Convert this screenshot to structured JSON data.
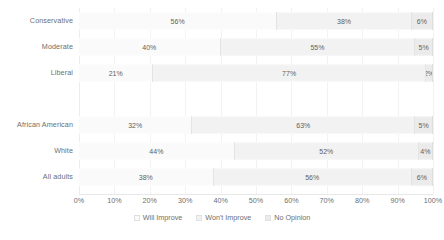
{
  "chart_data": {
    "type": "bar",
    "subtype": "stacked-horizontal-100-percent",
    "title": "",
    "subtitle": "",
    "xlabel": "",
    "ylabel": "",
    "xlim": [
      0,
      100
    ],
    "grid": true,
    "legend_position": "bottom",
    "value_suffix": "%",
    "categories": [
      "Conservative",
      "Moderate",
      "Liberal",
      "",
      "African American",
      "White",
      "All adults"
    ],
    "series": [
      {
        "name": "Will Improve",
        "color": "#fafafa",
        "values": [
          56,
          40,
          21,
          null,
          32,
          44,
          38
        ],
        "labels": [
          "56%",
          "40%",
          "21%",
          "",
          "32%",
          "44%",
          "38%"
        ]
      },
      {
        "name": "Won't Improve",
        "color": "#f2f2f2",
        "values": [
          38,
          55,
          77,
          null,
          63,
          52,
          56
        ],
        "labels": [
          "38%",
          "55%",
          "77%",
          "",
          "63%",
          "52%",
          "56%"
        ]
      },
      {
        "name": "No Opinion",
        "color": "#ebebeb",
        "values": [
          6,
          5,
          2,
          null,
          5,
          4,
          6
        ],
        "labels": [
          "6%",
          "5%",
          "2%",
          "",
          "5%",
          "4%",
          "6%"
        ]
      }
    ],
    "xticks": [
      0,
      10,
      20,
      30,
      40,
      50,
      60,
      70,
      80,
      90,
      100
    ],
    "xtick_labels": [
      "0%",
      "10%",
      "20%",
      "30%",
      "40%",
      "50%",
      "60%",
      "70%",
      "80%",
      "90%",
      "100%"
    ],
    "legend": [
      "Will Improve",
      "Won't Improve",
      "No Opinion"
    ]
  }
}
